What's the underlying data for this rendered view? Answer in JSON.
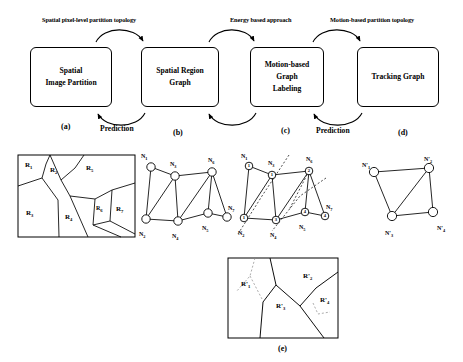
{
  "figure": {
    "caption_e": "(e)",
    "flow_labels": [
      {
        "text": "Spatial pixel-level partition topology",
        "x": 42,
        "y": 18
      },
      {
        "text": "Energy based approach",
        "x": 228,
        "y": 18
      },
      {
        "text": "Motion-based partition topology",
        "x": 330,
        "y": 18
      }
    ],
    "prediction_labels": [
      {
        "text": "Prediction",
        "x": 106,
        "y": 127
      },
      {
        "text": "Prediction",
        "x": 318,
        "y": 127
      }
    ],
    "boxes": [
      {
        "id": "a",
        "lines": [
          "Spatial",
          "Image Partition"
        ],
        "x": 30,
        "y": 47,
        "w": 82,
        "h": 60,
        "caption": "(a)",
        "cap_x": 62,
        "cap_y": 124
      },
      {
        "id": "b",
        "lines": [
          "Spatial Region",
          "Graph"
        ],
        "x": 141,
        "y": 47,
        "w": 78,
        "h": 60,
        "caption": "(b)",
        "cap_x": 173,
        "cap_y": 129
      },
      {
        "id": "c",
        "lines": [
          "Motion-based",
          "Graph",
          "Labeling"
        ],
        "x": 250,
        "y": 47,
        "w": 74,
        "h": 60,
        "caption": "(c)",
        "cap_x": 281,
        "cap_y": 127
      },
      {
        "id": "d",
        "lines": [
          "Tracking Graph"
        ],
        "x": 357,
        "y": 47,
        "w": 82,
        "h": 60,
        "caption": "(d)",
        "cap_x": 398,
        "cap_y": 129
      }
    ],
    "panel_a_regions": [
      {
        "label": "R",
        "sub": "1",
        "x": 26,
        "y": 165
      },
      {
        "label": "R",
        "sub": "2",
        "x": 51,
        "y": 170
      },
      {
        "label": "R",
        "sub": "5",
        "x": 87,
        "y": 167
      },
      {
        "label": "R",
        "sub": "3",
        "x": 28,
        "y": 213
      },
      {
        "label": "R",
        "sub": "4",
        "x": 67,
        "y": 217
      },
      {
        "label": "R",
        "sub": "6",
        "x": 98,
        "y": 209
      },
      {
        "label": "R",
        "sub": "7",
        "x": 117,
        "y": 209
      }
    ],
    "panel_b_nodes": [
      {
        "label": "N",
        "sub": "1",
        "cx": 151,
        "cy": 167,
        "lx": 141,
        "ly": 153
      },
      {
        "label": "N",
        "sub": "3",
        "cx": 175,
        "cy": 176,
        "lx": 170,
        "ly": 161
      },
      {
        "label": "N",
        "sub": "6",
        "cx": 212,
        "cy": 172,
        "lx": 208,
        "ly": 157
      },
      {
        "label": "N",
        "sub": "2",
        "cx": 146,
        "cy": 219,
        "lx": 139,
        "ly": 231
      },
      {
        "label": "N",
        "sub": "4",
        "cx": 178,
        "cy": 221,
        "lx": 172,
        "ly": 233
      },
      {
        "label": "N",
        "sub": "5",
        "cx": 208,
        "cy": 213,
        "lx": 202,
        "ly": 225
      },
      {
        "label": "N",
        "sub": "7",
        "cx": 227,
        "cy": 217,
        "lx": 228,
        "ly": 205
      }
    ],
    "panel_b_edges": [
      [
        0,
        1
      ],
      [
        0,
        3
      ],
      [
        1,
        2
      ],
      [
        1,
        3
      ],
      [
        1,
        4
      ],
      [
        3,
        4
      ],
      [
        4,
        5
      ],
      [
        4,
        2
      ],
      [
        2,
        5
      ],
      [
        2,
        6
      ],
      [
        5,
        6
      ]
    ],
    "panel_c_nodes": [
      {
        "label": "N",
        "sub": "1",
        "num": "1",
        "cx": 249,
        "cy": 166,
        "lx": 241,
        "ly": 153
      },
      {
        "label": "N",
        "sub": "3",
        "num": "1",
        "cx": 272,
        "cy": 175,
        "lx": 268,
        "ly": 160
      },
      {
        "label": "N",
        "sub": "6",
        "num": "2",
        "cx": 309,
        "cy": 171,
        "lx": 306,
        "ly": 156
      },
      {
        "label": "N",
        "sub": "2",
        "num": "1",
        "cx": 244,
        "cy": 218,
        "lx": 238,
        "ly": 230
      },
      {
        "label": "N",
        "sub": "4",
        "num": "3",
        "cx": 276,
        "cy": 220,
        "lx": 270,
        "ly": 232
      },
      {
        "label": "N",
        "sub": "5",
        "num": "4",
        "cx": 305,
        "cy": 212,
        "lx": 299,
        "ly": 224
      },
      {
        "label": "N",
        "sub": "7",
        "num": "4",
        "cx": 325,
        "cy": 216,
        "lx": 326,
        "ly": 204
      }
    ],
    "panel_c_edges": [
      [
        0,
        1
      ],
      [
        0,
        3
      ],
      [
        1,
        2
      ],
      [
        1,
        3
      ],
      [
        1,
        4
      ],
      [
        3,
        4
      ],
      [
        4,
        5
      ],
      [
        4,
        2
      ],
      [
        2,
        5
      ],
      [
        2,
        6
      ],
      [
        5,
        6
      ]
    ],
    "panel_d_nodes": [
      {
        "label": "N'",
        "sub": "1",
        "cx": 374,
        "cy": 172,
        "lx": 362,
        "ly": 162
      },
      {
        "label": "N'",
        "sub": "2",
        "cx": 429,
        "cy": 168,
        "lx": 424,
        "ly": 156
      },
      {
        "label": "N'",
        "sub": "3",
        "cx": 392,
        "cy": 216,
        "lx": 385,
        "ly": 230
      },
      {
        "label": "N'",
        "sub": "4",
        "cx": 433,
        "cy": 212,
        "lx": 437,
        "ly": 225
      }
    ],
    "panel_d_edges": [
      [
        0,
        1
      ],
      [
        0,
        2
      ],
      [
        1,
        2
      ],
      [
        1,
        3
      ],
      [
        2,
        3
      ]
    ],
    "panel_e_regions": [
      {
        "label": "R'",
        "sub": "1",
        "x": 240,
        "y": 283
      },
      {
        "label": "R'",
        "sub": "2",
        "x": 305,
        "y": 275
      },
      {
        "label": "R'",
        "sub": "3",
        "x": 277,
        "y": 305
      },
      {
        "label": "R'",
        "sub": "4",
        "x": 321,
        "y": 300
      }
    ]
  }
}
